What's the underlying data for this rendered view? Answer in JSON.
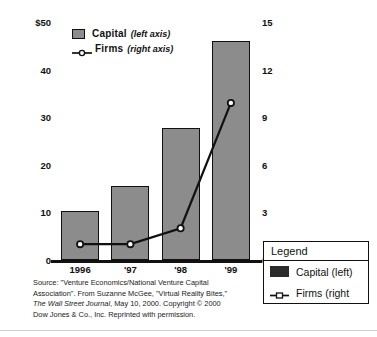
{
  "chart_data": {
    "type": "bar",
    "title": "",
    "subtitle": "",
    "categories": [
      "1996",
      "'97",
      "'98",
      "'99"
    ],
    "series": [
      {
        "name": "Capital",
        "axis": "left",
        "type": "bar",
        "values": [
          10.3,
          15.5,
          27.7,
          46.0
        ]
      },
      {
        "name": "Firms",
        "axis": "right",
        "type": "line",
        "values": [
          1.0,
          1.0,
          2.0,
          9.9
        ]
      }
    ],
    "xlabel": "",
    "ylabel": "",
    "ylim": [
      0,
      50
    ],
    "y2lim": [
      0,
      15
    ],
    "yticks": [
      "$50",
      "40",
      "30",
      "20",
      "10",
      "0"
    ],
    "ytick_values": [
      50,
      40,
      30,
      20,
      10,
      0
    ],
    "y2ticks": [
      "15",
      "12",
      "9",
      "6",
      "3",
      "0"
    ],
    "y2tick_values": [
      15,
      12,
      9,
      6,
      3,
      0
    ],
    "grid": false,
    "legend_position": "inside-top-left",
    "colors": {
      "bar_fill": "#8c8c8c",
      "bar_border": "#111111",
      "line": "#111111",
      "marker_fill": "#ffffff"
    }
  },
  "inline_legend": {
    "items": [
      {
        "name": "Capital",
        "axis_note": "(left axis)",
        "marker": "square-swatch-icon"
      },
      {
        "name": "Firms",
        "axis_note": "(right axis)",
        "marker": "line-marker-icon"
      }
    ]
  },
  "source_note": {
    "line1": "Source: \"Venture Economics/National Venture Capital",
    "line2": "Association\". From Suzanne McGee, \"Virtual Reality Bites,\"",
    "line3_italic": "The Wall Street Journal",
    "line3_rest": ", May 10, 2000. Copyright © 2000",
    "line4": "Dow Jones & Co., Inc. Reprinted with permission."
  },
  "legend_box": {
    "title": "Legend",
    "rows": [
      {
        "label": "Capital (left)",
        "marker": "filled-square-icon"
      },
      {
        "label": "Firms (right",
        "marker": "line-marker-icon"
      }
    ]
  }
}
